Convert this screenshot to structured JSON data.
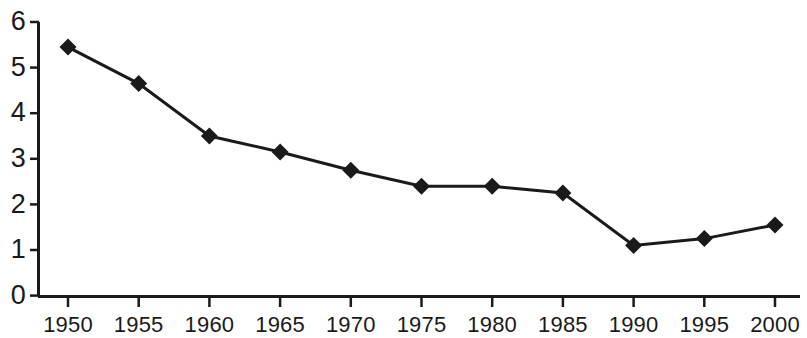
{
  "chart_data": {
    "type": "line",
    "title": "",
    "subtitle": "",
    "xlabel": "",
    "ylabel": "",
    "x": [
      1950,
      1955,
      1960,
      1965,
      1970,
      1975,
      1980,
      1985,
      1990,
      1995,
      2000
    ],
    "values": [
      5.45,
      4.65,
      3.5,
      3.15,
      2.75,
      2.4,
      2.4,
      2.25,
      1.1,
      1.25,
      1.55
    ],
    "series": [
      {
        "name": "",
        "values": [
          5.45,
          4.65,
          3.5,
          3.15,
          2.75,
          2.4,
          2.4,
          2.25,
          1.1,
          1.25,
          1.55
        ]
      }
    ],
    "x_tick_labels": [
      "1950",
      "1955",
      "1960",
      "1965",
      "1970",
      "1975",
      "1980",
      "1985",
      "1990",
      "1995",
      "2000"
    ],
    "y_tick_labels": [
      "0",
      "1",
      "2",
      "3",
      "4",
      "5",
      "6"
    ],
    "y_ticks": [
      0,
      1,
      2,
      3,
      4,
      5,
      6
    ],
    "xlim": [
      1947.5,
      2002.5
    ],
    "ylim": [
      0,
      6
    ],
    "grid": false,
    "legend": "none",
    "marker": "diamond",
    "line_color": "#1a1a1a",
    "marker_color": "#1a1a1a",
    "background_color": "#ffffff",
    "axis_color": "#1a1a1a"
  },
  "axes": {
    "y_axis_name": "y-axis",
    "x_axis_name": "x-axis"
  }
}
